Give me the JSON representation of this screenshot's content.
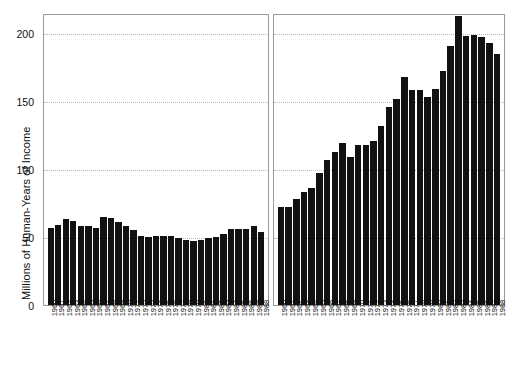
{
  "chart_data": {
    "type": "bar",
    "title": "",
    "xlabel": "",
    "ylabel": "Millions of Human-Years of Income",
    "ylim": [
      0,
      215
    ],
    "yticks": [
      0,
      50,
      100,
      150,
      200
    ],
    "ytick_labels": [
      "0",
      "50",
      "100",
      "150",
      "200"
    ],
    "grid": true,
    "grid_axis": "y",
    "grid_style": "dotted",
    "legend": "none",
    "bar_color": "#111111",
    "panels": [
      {
        "name": "left-panel",
        "categories": [
          "1960",
          "1961",
          "1962",
          "1963",
          "1964",
          "1965",
          "1966",
          "1967",
          "1968",
          "1969",
          "1970",
          "1971",
          "1972",
          "1973",
          "1974",
          "1975",
          "1976",
          "1977",
          "1978",
          "1979",
          "1980",
          "1981",
          "1982",
          "1983",
          "1984",
          "1985",
          "1986",
          "1987",
          "1988"
        ],
        "values": [
          57,
          59,
          63,
          62,
          58,
          58,
          57,
          65,
          64,
          61,
          58,
          55,
          51,
          50,
          51,
          51,
          51,
          49,
          48,
          47,
          48,
          49,
          50,
          52,
          56,
          56,
          56,
          58,
          54
        ]
      },
      {
        "name": "right-panel",
        "categories": [
          "1960",
          "1961",
          "1962",
          "1963",
          "1964",
          "1965",
          "1966",
          "1967",
          "1968",
          "1969",
          "1970",
          "1971",
          "1972",
          "1973",
          "1974",
          "1975",
          "1976",
          "1977",
          "1978",
          "1979",
          "1980",
          "1981",
          "1982",
          "1983",
          "1984",
          "1985",
          "1986",
          "1987",
          "1988"
        ],
        "values": [
          72,
          72,
          78,
          83,
          86,
          97,
          107,
          113,
          119,
          109,
          118,
          118,
          121,
          132,
          146,
          152,
          168,
          158,
          158,
          153,
          159,
          172,
          191,
          213,
          198,
          199,
          197,
          193,
          185
        ]
      }
    ]
  },
  "axis": {
    "ylabel": "Millions of Human-Years of Income",
    "ytick_labels": [
      "200",
      "150",
      "100",
      "50",
      "0"
    ]
  }
}
